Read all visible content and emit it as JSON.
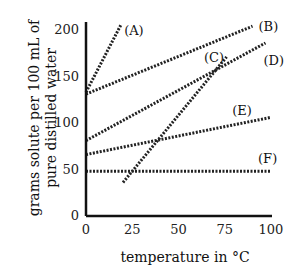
{
  "chart_data": {
    "type": "line",
    "title": "",
    "xlabel": "temperature in °C",
    "ylabel_line1": "grams solute per 100 mL of",
    "ylabel_line2": "pure distilled water",
    "xlim": [
      0,
      100
    ],
    "ylim": [
      0,
      200
    ],
    "x_ticks": [
      "0",
      "25",
      "50",
      "75",
      "100"
    ],
    "y_ticks": [
      "0",
      "50",
      "100",
      "150",
      "200"
    ],
    "grid": false,
    "line_style": "dashed",
    "series": [
      {
        "name": "(A)",
        "x": [
          0,
          19
        ],
        "y": [
          132,
          205
        ]
      },
      {
        "name": "(B)",
        "x": [
          0,
          90
        ],
        "y": [
          130,
          203
        ]
      },
      {
        "name": "(C)",
        "x": [
          20,
          76
        ],
        "y": [
          35,
          170
        ]
      },
      {
        "name": "(D)",
        "x": [
          0,
          97
        ],
        "y": [
          80,
          185
        ]
      },
      {
        "name": "(E)",
        "x": [
          0,
          100
        ],
        "y": [
          65,
          105
        ]
      },
      {
        "name": "(F)",
        "x": [
          0,
          100
        ],
        "y": [
          47,
          47
        ]
      }
    ]
  }
}
